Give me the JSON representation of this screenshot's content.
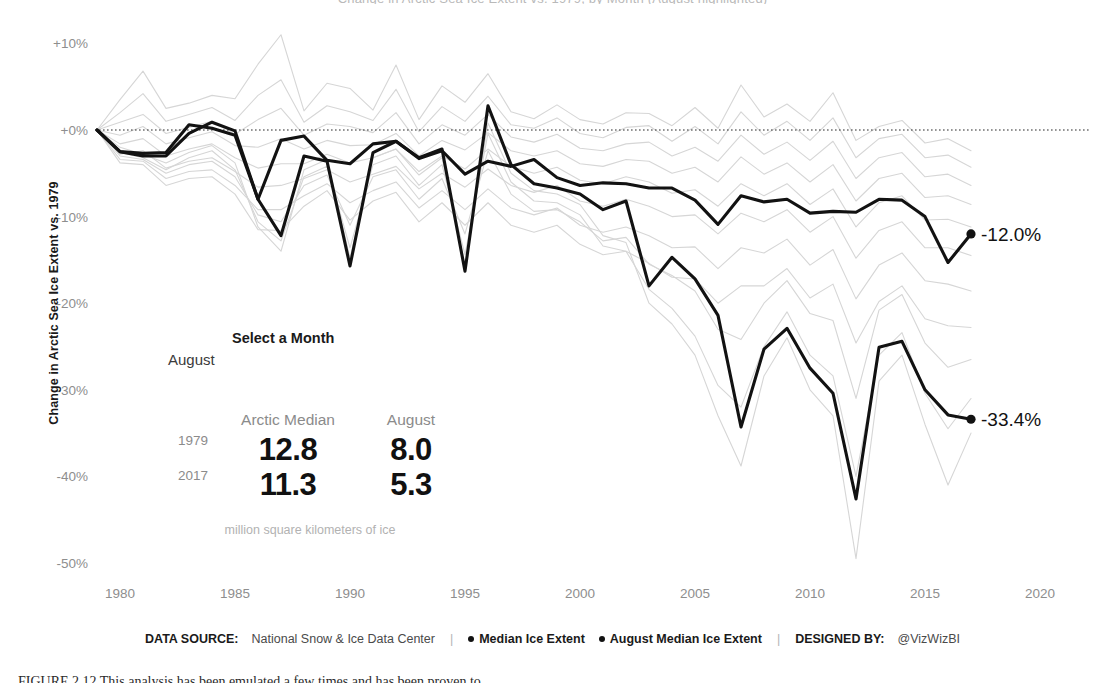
{
  "figure": {
    "clipped_top_title": "Change in Arctic Sea Ice Extent vs. 1979, by Month (August highlighted)",
    "clipped_bottom_caption": "FIGURE 2.12   This analysis has been emulated a few times and has been proven to",
    "caption_label": "FIGURE 2.12"
  },
  "axes": {
    "y_title": "Change in Arctic Sea Ice Extent vs. 1979",
    "y_ticks": [
      "+10%",
      "+0%",
      "-10%",
      "-20%",
      "-30%",
      "-40%",
      "-50%"
    ],
    "y_tick_values": [
      10,
      0,
      -10,
      -20,
      -30,
      -40,
      -50
    ],
    "x_ticks": [
      "1980",
      "1985",
      "1990",
      "1995",
      "2000",
      "2005",
      "2010",
      "2015",
      "2020"
    ],
    "x_tick_values": [
      1980,
      1985,
      1990,
      1995,
      2000,
      2005,
      2010,
      2015,
      2020
    ],
    "zero_reference": 0
  },
  "controls": {
    "month_picker_label": "Select a Month",
    "month_picker_value": "August",
    "month_options": [
      "January",
      "February",
      "March",
      "April",
      "May",
      "June",
      "July",
      "August",
      "September",
      "October",
      "November",
      "December"
    ]
  },
  "stats": {
    "headers": [
      "",
      "Arctic Median",
      "August"
    ],
    "rows": [
      {
        "year": "1979",
        "median": "12.8",
        "month": "8.0"
      },
      {
        "year": "2017",
        "median": "11.3",
        "month": "5.3"
      }
    ],
    "footnote": "million square kilometers of ice"
  },
  "footer": {
    "source_key": "DATA SOURCE:",
    "source_value": "National Snow & Ice Data Center",
    "separator": "|",
    "legend": [
      {
        "label": "Median Ice Extent",
        "color": "#121212"
      },
      {
        "label": "August Median Ice Extent",
        "color": "#121212"
      }
    ],
    "designer_key": "DESIGNED BY:",
    "designer_value": "@VizWizBI"
  },
  "colors": {
    "highlight": "#121212",
    "context": "#d6d6d6",
    "tick_text": "#8e8e8e",
    "muted_text": "#b2b2b2",
    "background": "#ffffff"
  },
  "chart_data": {
    "type": "line",
    "title": "Change in Arctic Sea Ice Extent vs. 1979",
    "xlabel": "",
    "ylabel": "Change in Arctic Sea Ice Extent vs. 1979",
    "xlim": [
      1979,
      2020
    ],
    "ylim": [
      -52,
      12
    ],
    "grid": false,
    "legend_position": "bottom",
    "x": [
      1979,
      1980,
      1981,
      1982,
      1983,
      1984,
      1985,
      1986,
      1987,
      1988,
      1989,
      1990,
      1991,
      1992,
      1993,
      1994,
      1995,
      1996,
      1997,
      1998,
      1999,
      2000,
      2001,
      2002,
      2003,
      2004,
      2005,
      2006,
      2007,
      2008,
      2009,
      2010,
      2011,
      2012,
      2013,
      2014,
      2015,
      2016,
      2017
    ],
    "end_labels": [
      {
        "series": "Median Ice Extent",
        "value": -12.0,
        "text": "-12.0%",
        "year": 2017
      },
      {
        "series": "August Median Ice Extent",
        "value": -33.4,
        "text": "-33.4%",
        "year": 2017
      }
    ],
    "series": [
      {
        "name": "Median Ice Extent",
        "highlight": true,
        "color": "#121212",
        "values": [
          0.0,
          -2.5,
          -2.7,
          -2.6,
          0.6,
          0.2,
          -0.6,
          -8.0,
          -1.2,
          -0.7,
          -3.5,
          -3.9,
          -1.6,
          -1.3,
          -3.3,
          -2.4,
          -5.1,
          -3.6,
          -4.2,
          -3.4,
          -5.5,
          -6.4,
          -6.1,
          -6.2,
          -6.7,
          -6.7,
          -8.1,
          -10.9,
          -7.6,
          -8.3,
          -8.0,
          -9.6,
          -9.4,
          -9.5,
          -8.0,
          -8.1,
          -10.0,
          -15.3,
          -12.0
        ]
      },
      {
        "name": "August Median Ice Extent",
        "highlight": true,
        "color": "#121212",
        "values": [
          0.0,
          -2.5,
          -3.0,
          -3.0,
          -0.4,
          0.9,
          -0.1,
          -8.0,
          -12.2,
          -3.0,
          -3.6,
          -15.7,
          -2.6,
          -1.3,
          -3.2,
          -2.2,
          -16.3,
          2.8,
          -4.0,
          -6.2,
          -6.7,
          -7.4,
          -9.2,
          -8.2,
          -18.0,
          -14.7,
          -17.2,
          -21.4,
          -34.3,
          -25.3,
          -22.9,
          -27.5,
          -30.4,
          -42.6,
          -25.1,
          -24.4,
          -30.0,
          -32.9,
          -33.4
        ]
      },
      {
        "name": "Month series (context)",
        "highlight": false,
        "color": "#d6d6d6",
        "values": [
          0.0,
          3.5,
          6.8,
          2.5,
          3.1,
          4.0,
          3.6,
          7.6,
          11.0,
          2.2,
          5.4,
          4.8,
          2.3,
          7.5,
          1.2,
          5.1,
          3.2,
          6.5,
          2.1,
          1.3,
          2.9,
          1.2,
          0.7,
          2.0,
          1.9,
          0.5,
          2.6,
          0.2,
          5.2,
          1.5,
          3.0,
          1.0,
          4.3,
          -1.2,
          0.4,
          1.1,
          -1.5,
          -1.0,
          -2.4
        ]
      },
      {
        "name": "Month series (context)",
        "highlight": false,
        "color": "#d6d6d6",
        "values": [
          0.0,
          2.0,
          4.2,
          1.0,
          1.8,
          2.6,
          1.1,
          4.0,
          5.8,
          0.9,
          2.8,
          2.1,
          1.1,
          4.7,
          -0.2,
          2.7,
          1.0,
          3.9,
          0.6,
          0.2,
          1.4,
          -0.4,
          -0.9,
          0.3,
          0.5,
          -1.3,
          0.4,
          -1.6,
          2.1,
          -0.6,
          1.0,
          -1.2,
          1.4,
          -3.2,
          -1.0,
          -0.5,
          -3.2,
          -2.9,
          -4.3
        ]
      },
      {
        "name": "Month series (context)",
        "highlight": false,
        "color": "#d6d6d6",
        "values": [
          0.0,
          0.9,
          1.8,
          -0.4,
          0.3,
          1.0,
          -0.5,
          1.2,
          2.5,
          -0.6,
          0.7,
          0.4,
          -0.3,
          2.0,
          -1.6,
          0.6,
          -0.6,
          1.8,
          -0.8,
          -1.4,
          -0.5,
          -2.1,
          -2.4,
          -1.6,
          -1.4,
          -3.0,
          -2.0,
          -3.6,
          -0.6,
          -2.8,
          -1.4,
          -3.5,
          -1.3,
          -5.6,
          -3.2,
          -2.6,
          -5.4,
          -5.1,
          -6.4
        ]
      },
      {
        "name": "Month series (context)",
        "highlight": false,
        "color": "#d6d6d6",
        "values": [
          0.0,
          -0.6,
          0.4,
          -1.6,
          -0.9,
          -0.2,
          -1.8,
          -2.0,
          -1.0,
          -2.2,
          -1.2,
          -1.8,
          -1.7,
          -0.4,
          -3.0,
          -1.2,
          -2.3,
          -0.3,
          -2.4,
          -3.0,
          -2.4,
          -3.9,
          -4.2,
          -3.4,
          -3.6,
          -5.0,
          -4.3,
          -6.0,
          -3.1,
          -5.1,
          -3.8,
          -6.0,
          -4.0,
          -8.2,
          -5.6,
          -5.0,
          -7.8,
          -7.6,
          -8.6
        ]
      },
      {
        "name": "Month series (context)",
        "highlight": false,
        "color": "#d6d6d6",
        "values": [
          0.0,
          -1.6,
          -1.0,
          -3.0,
          -2.2,
          -1.6,
          -3.2,
          -4.4,
          -3.9,
          -3.9,
          -2.8,
          -3.8,
          -3.2,
          -2.2,
          -4.8,
          -3.0,
          -4.5,
          -2.2,
          -4.2,
          -5.0,
          -4.3,
          -5.8,
          -6.2,
          -5.4,
          -6.0,
          -7.3,
          -6.9,
          -8.8,
          -6.2,
          -7.6,
          -6.2,
          -8.6,
          -6.8,
          -11.2,
          -8.4,
          -7.6,
          -10.4,
          -10.3,
          -11.2
        ]
      },
      {
        "name": "Month series (context)",
        "highlight": false,
        "color": "#d6d6d6",
        "values": [
          0.0,
          -2.8,
          -2.4,
          -4.4,
          -3.6,
          -3.2,
          -4.8,
          -6.6,
          -6.4,
          -5.6,
          -4.6,
          -6.0,
          -5.1,
          -4.2,
          -6.8,
          -5.0,
          -6.6,
          -4.5,
          -6.4,
          -7.2,
          -6.4,
          -8.2,
          -8.8,
          -8.0,
          -8.8,
          -10.0,
          -9.8,
          -12.0,
          -9.6,
          -10.6,
          -9.2,
          -11.8,
          -10.0,
          -14.8,
          -11.6,
          -10.6,
          -13.6,
          -13.6,
          -14.5
        ]
      },
      {
        "name": "Month series (context)",
        "highlight": false,
        "color": "#d6d6d6",
        "values": [
          0.0,
          -3.4,
          -3.6,
          -5.6,
          -4.8,
          -4.6,
          -6.4,
          -9.2,
          -9.2,
          -7.6,
          -6.2,
          -8.4,
          -7.0,
          -6.0,
          -9.0,
          -7.0,
          -9.2,
          -6.8,
          -9.0,
          -9.8,
          -9.0,
          -11.0,
          -11.8,
          -11.2,
          -12.2,
          -13.6,
          -13.5,
          -16.0,
          -13.6,
          -14.2,
          -12.6,
          -15.6,
          -13.8,
          -19.5,
          -15.6,
          -14.2,
          -17.4,
          -17.8,
          -18.6
        ]
      },
      {
        "name": "Month series (context)",
        "highlight": false,
        "color": "#d6d6d6",
        "values": [
          0.0,
          -3.0,
          -3.4,
          -5.0,
          -4.0,
          -3.6,
          -5.4,
          -9.8,
          -10.6,
          -6.4,
          -5.2,
          -11.0,
          -5.4,
          -4.6,
          -8.0,
          -5.6,
          -12.0,
          -2.4,
          -7.4,
          -9.4,
          -9.2,
          -10.6,
          -12.8,
          -12.4,
          -15.5,
          -16.8,
          -18.6,
          -23.0,
          -24.2,
          -20.0,
          -17.4,
          -21.2,
          -22.0,
          -31.0,
          -20.8,
          -19.0,
          -24.6,
          -27.4,
          -26.5
        ]
      },
      {
        "name": "Month series (context)",
        "highlight": false,
        "color": "#d6d6d6",
        "values": [
          0.0,
          -2.6,
          -3.2,
          -4.6,
          -3.2,
          -2.4,
          -4.6,
          -10.6,
          -12.8,
          -5.4,
          -4.2,
          -13.6,
          -4.0,
          -3.0,
          -6.4,
          -4.0,
          -14.4,
          -0.4,
          -6.0,
          -8.2,
          -8.4,
          -9.8,
          -13.4,
          -14.0,
          -18.4,
          -20.6,
          -23.8,
          -29.5,
          -32.0,
          -25.0,
          -21.0,
          -26.0,
          -28.4,
          -40.0,
          -26.0,
          -23.4,
          -30.4,
          -34.5,
          -31.0
        ]
      },
      {
        "name": "Month series (context)",
        "highlight": false,
        "color": "#d6d6d6",
        "values": [
          0.0,
          -3.8,
          -4.0,
          -6.4,
          -5.6,
          -5.4,
          -7.4,
          -11.5,
          -11.6,
          -8.8,
          -7.0,
          -10.4,
          -8.2,
          -7.2,
          -10.6,
          -8.4,
          -11.0,
          -8.4,
          -11.0,
          -11.8,
          -11.0,
          -13.2,
          -14.4,
          -14.0,
          -15.4,
          -17.0,
          -17.2,
          -20.0,
          -18.0,
          -18.0,
          -16.0,
          -19.4,
          -17.8,
          -24.6,
          -19.8,
          -18.0,
          -21.8,
          -22.6,
          -22.8
        ]
      },
      {
        "name": "Month series (context)",
        "highlight": false,
        "color": "#d6d6d6",
        "values": [
          0.0,
          -2.0,
          -2.8,
          -3.8,
          -2.6,
          -1.8,
          -3.8,
          -11.2,
          -14.0,
          -4.6,
          -3.4,
          -14.8,
          -3.2,
          -2.2,
          -5.2,
          -3.2,
          -15.6,
          0.8,
          -5.0,
          -7.0,
          -7.4,
          -8.6,
          -12.2,
          -13.0,
          -20.0,
          -22.4,
          -26.0,
          -33.0,
          -38.8,
          -28.4,
          -24.0,
          -30.0,
          -33.0,
          -49.5,
          -29.0,
          -26.0,
          -34.0,
          -41.0,
          -35.0
        ]
      }
    ]
  }
}
